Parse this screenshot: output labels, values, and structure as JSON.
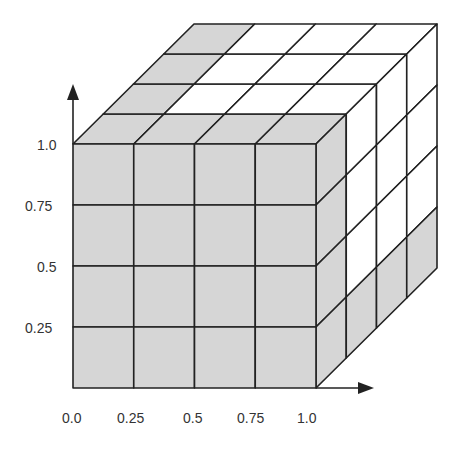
{
  "diagram": {
    "type": "3d-grid-cube",
    "divisions": 4,
    "shade_color": "#d6d6d6",
    "line_color": "#222222",
    "background": "#ffffff",
    "y_axis": {
      "ticks": [
        "1.0",
        "0.75",
        "0.5",
        "0.25"
      ]
    },
    "x_axis": {
      "ticks": [
        "0.0",
        "0.25",
        "0.5",
        "0.75",
        "1.0"
      ]
    }
  }
}
